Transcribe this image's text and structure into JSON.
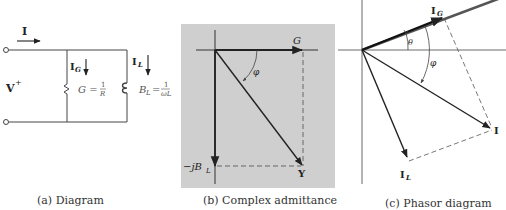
{
  "panels": {
    "a": {
      "caption": "(a) Diagram",
      "labels": {
        "current_total": "I",
        "voltage": "V",
        "voltage_sign": "+",
        "current_g": "I",
        "current_g_sub": "G",
        "current_l": "I",
        "current_l_sub": "L",
        "conductance": "G =",
        "conductance_num": "1",
        "conductance_den": "R",
        "susceptance": "B",
        "susceptance_sub": "L",
        "susceptance_eq": "=",
        "susceptance_num": "1",
        "susceptance_den": "ωL"
      }
    },
    "b": {
      "caption": "(b) Complex admittance",
      "labels": {
        "real_axis": "G",
        "angle": "φ",
        "imag_axis": "−jB",
        "imag_axis_sub": "L",
        "admittance": "Y"
      },
      "background": "#cfcfcf"
    },
    "c": {
      "caption": "(c) Phasor diagram",
      "labels": {
        "current_g": "I",
        "current_g_sub": "G",
        "theta": "θ",
        "phi": "φ",
        "current_total": "I",
        "current_l": "I",
        "current_l_sub": "L"
      }
    }
  }
}
